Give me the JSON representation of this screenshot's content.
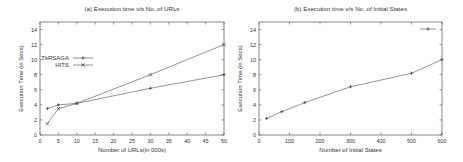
{
  "chart_data": [
    {
      "type": "line",
      "title": "(a) Execution time v/s No. of URLs",
      "xlabel": "Number of URLs(in 000s)",
      "ylabel": "Execution Time (in Secs)",
      "xlim": [
        0,
        50
      ],
      "ylim": [
        0,
        15
      ],
      "xticks": [
        0,
        5,
        10,
        15,
        20,
        25,
        30,
        35,
        40,
        45,
        50
      ],
      "yticks": [
        0,
        2,
        4,
        6,
        8,
        10,
        12,
        14
      ],
      "grid": false,
      "legend_position": "left-middle",
      "x": [
        2,
        5,
        10,
        30,
        50
      ],
      "series": [
        {
          "name": "TkRSAGA",
          "marker": "+",
          "values": [
            3.5,
            4.0,
            4.2,
            6.2,
            8.0
          ]
        },
        {
          "name": "HITS",
          "marker": "x",
          "values": [
            1.5,
            3.5,
            4.2,
            8.0,
            12.0
          ]
        }
      ]
    },
    {
      "type": "line",
      "title": "(b) Execution time v/s No. of Initial States",
      "xlabel": "Number of Initial States",
      "ylabel": "Execution Time (in Secs)",
      "xlim": [
        0,
        600
      ],
      "ylim": [
        0,
        15
      ],
      "xticks": [
        0,
        100,
        200,
        300,
        400,
        500,
        600
      ],
      "yticks": [
        0,
        2,
        4,
        6,
        8,
        10,
        12,
        14
      ],
      "grid": false,
      "legend_position": "top-right",
      "x": [
        25,
        75,
        150,
        300,
        500,
        600
      ],
      "series": [
        {
          "name": "",
          "marker": "+",
          "values": [
            2.2,
            3.1,
            4.3,
            6.4,
            8.2,
            10.0
          ]
        }
      ]
    }
  ]
}
